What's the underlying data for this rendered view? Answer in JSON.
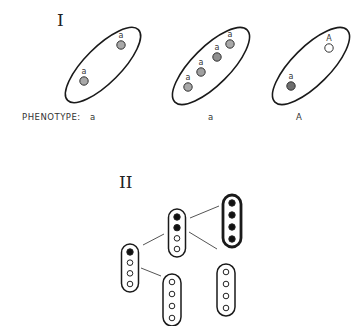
{
  "part_one": {
    "numeral": "I",
    "cells": [
      {
        "cx": 103,
        "cy": 65,
        "rx": 50,
        "ry": 18,
        "rotate": -45,
        "chromosomes": [
          {
            "x": 121,
            "y": 45,
            "label": "a",
            "fill": "#a8a8a8"
          },
          {
            "x": 84,
            "y": 81,
            "label": "a",
            "fill": "#a8a8a8"
          }
        ],
        "phenotype": "a"
      },
      {
        "cx": 211,
        "cy": 66,
        "rx": 51,
        "ry": 19,
        "rotate": -45,
        "chromosomes": [
          {
            "x": 230,
            "y": 44,
            "label": "a",
            "fill": "#a8a8a8"
          },
          {
            "x": 217,
            "y": 57,
            "label": "a",
            "fill": "#909090"
          },
          {
            "x": 201,
            "y": 72,
            "label": "a",
            "fill": "#a0a0a0"
          },
          {
            "x": 188,
            "y": 87,
            "label": "a",
            "fill": "#a8a8a8"
          }
        ],
        "phenotype": "a"
      },
      {
        "cx": 311,
        "cy": 66,
        "rx": 51,
        "ry": 19,
        "rotate": -45,
        "chromosomes": [
          {
            "x": 329,
            "y": 48,
            "label": "A",
            "fill": "#ffffff"
          },
          {
            "x": 291,
            "y": 86,
            "label": "a",
            "fill": "#6e6e6e"
          }
        ],
        "phenotype": "A"
      }
    ],
    "phenotype_prefix": "PHENOTYPE:",
    "phenotype_labels": [
      "a",
      "a",
      "A"
    ]
  },
  "part_two": {
    "numeral": "II",
    "cells": [
      {
        "id": "left",
        "cx": 130,
        "cy": 268,
        "w": 17,
        "h": 48,
        "thick": false,
        "dots": [
          "filled",
          "open",
          "open",
          "open"
        ]
      },
      {
        "id": "top-middle",
        "cx": 177,
        "cy": 233,
        "w": 17,
        "h": 48,
        "thick": false,
        "dots": [
          "filled",
          "filled",
          "open",
          "open"
        ]
      },
      {
        "id": "top-right",
        "cx": 232,
        "cy": 221,
        "w": 18,
        "h": 52,
        "thick": true,
        "dots": [
          "filled",
          "filled",
          "filled",
          "filled"
        ]
      },
      {
        "id": "bottom-middle",
        "cx": 172,
        "cy": 300,
        "w": 18,
        "h": 52,
        "thick": false,
        "dots": [
          "open",
          "open",
          "open",
          "open"
        ]
      },
      {
        "id": "bottom-right",
        "cx": 226,
        "cy": 290,
        "w": 18,
        "h": 52,
        "thick": false,
        "dots": [
          "open",
          "open",
          "open",
          "open"
        ]
      }
    ],
    "connections": [
      {
        "from": "left",
        "to": "top-middle",
        "x1": 143,
        "y1": 245,
        "x2": 164,
        "y2": 234
      },
      {
        "from": "left",
        "to": "bottom-middle",
        "x1": 141,
        "y1": 268,
        "x2": 161,
        "y2": 276
      },
      {
        "from": "top-middle",
        "to": "top-right",
        "x1": 190,
        "y1": 218,
        "x2": 219,
        "y2": 206
      },
      {
        "from": "top-middle",
        "to": "bottom-right",
        "x1": 189,
        "y1": 232,
        "x2": 217,
        "y2": 249
      }
    ]
  },
  "colors": {
    "stroke": "#1a1a1a",
    "connector": "#555555",
    "filled_dot": "#111111",
    "open_dot": "#ffffff"
  }
}
